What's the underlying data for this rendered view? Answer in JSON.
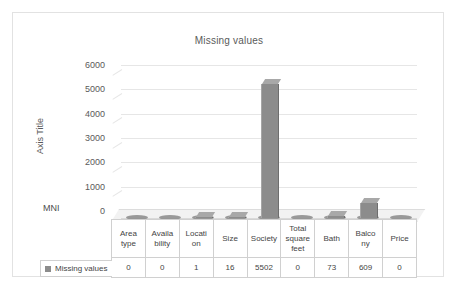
{
  "chart_data": {
    "type": "bar",
    "title": "Missing values",
    "xlabel": "",
    "ylabel": "Axis Title",
    "ylim": [
      0,
      6000
    ],
    "ytick_labels": [
      "6000",
      "5000",
      "4000",
      "3000",
      "2000",
      "1000",
      "0"
    ],
    "yticks": [
      6000,
      5000,
      4000,
      3000,
      2000,
      1000,
      0
    ],
    "grid": true,
    "legend_position": "bottom-left",
    "categories": [
      "Area type",
      "Availa bility",
      "Locati on",
      "Size",
      "Society",
      "Total square feet",
      "Bath",
      "Balco ny",
      "Price"
    ],
    "series": [
      {
        "name": "Missing values",
        "values": [
          0,
          0,
          1,
          16,
          5502,
          0,
          73,
          609,
          0
        ],
        "color": "#8c8c8c"
      }
    ],
    "annotations": [
      "MNI"
    ]
  },
  "chart": {
    "title": "Missing values",
    "axis_title": "Axis Title",
    "corner_label": "MNI",
    "series_color": "#8c8c8c",
    "grid_color": "#e6e6e6"
  },
  "y_axis": {
    "ticks": [
      "6000",
      "5000",
      "4000",
      "3000",
      "2000",
      "1000",
      "0"
    ]
  },
  "table": {
    "headers": [
      "Area type",
      "Availa bility",
      "Locati on",
      "Size",
      "Society",
      "Total square feet",
      "Bath",
      "Balco ny",
      "Price"
    ],
    "row_label": "Missing values",
    "values": [
      "0",
      "0",
      "1",
      "16",
      "5502",
      "0",
      "73",
      "609",
      "0"
    ]
  },
  "legend": {
    "label": "Missing values",
    "marker": "square-marker"
  }
}
